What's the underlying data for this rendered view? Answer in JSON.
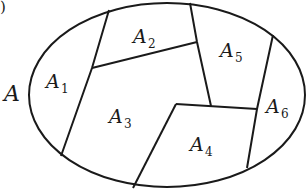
{
  "diagram": {
    "type": "set-partition",
    "set_label": "A",
    "corner_mark": ")",
    "regions": [
      {
        "name": "A",
        "sub": "1"
      },
      {
        "name": "A",
        "sub": "2"
      },
      {
        "name": "A",
        "sub": "3"
      },
      {
        "name": "A",
        "sub": "4"
      },
      {
        "name": "A",
        "sub": "5"
      },
      {
        "name": "A",
        "sub": "6"
      }
    ],
    "stroke_color": "#1a1a1a",
    "background": "#ffffff"
  }
}
